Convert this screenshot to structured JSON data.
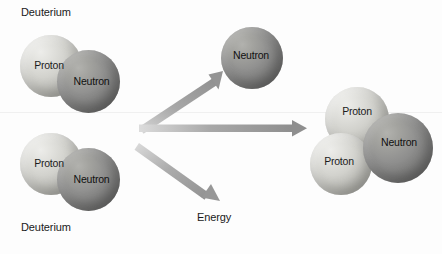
{
  "diagram": {
    "background_color": "#fdfdfd",
    "colors": {
      "proton": "#d2d2cd",
      "neutron": "#8a8a88",
      "arrow": "#9a9a9a",
      "text": "#1a1a1a"
    }
  },
  "reactants": [
    {
      "name": "deuterium-top",
      "caption": "Deuterium",
      "caption_position": "above",
      "particles": [
        {
          "label": "Proton",
          "type": "proton"
        },
        {
          "label": "Neutron",
          "type": "neutron"
        }
      ]
    },
    {
      "name": "deuterium-bottom",
      "caption": "Deuterium",
      "caption_position": "below",
      "particles": [
        {
          "label": "Proton",
          "type": "proton"
        },
        {
          "label": "Neutron",
          "type": "neutron"
        }
      ]
    }
  ],
  "products": [
    {
      "name": "free-neutron",
      "particles": [
        {
          "label": "Neutron",
          "type": "neutron"
        }
      ]
    },
    {
      "name": "helium-nucleus",
      "particles": [
        {
          "label": "Proton",
          "type": "proton"
        },
        {
          "label": "Proton",
          "type": "proton"
        },
        {
          "label": "Neutron",
          "type": "neutron"
        }
      ]
    },
    {
      "name": "energy-output",
      "caption": "Energy"
    }
  ],
  "arrows": [
    {
      "name": "arrow-to-neutron",
      "direction": "up-right"
    },
    {
      "name": "arrow-to-nucleus",
      "direction": "right"
    },
    {
      "name": "arrow-to-energy",
      "direction": "down-right"
    }
  ]
}
